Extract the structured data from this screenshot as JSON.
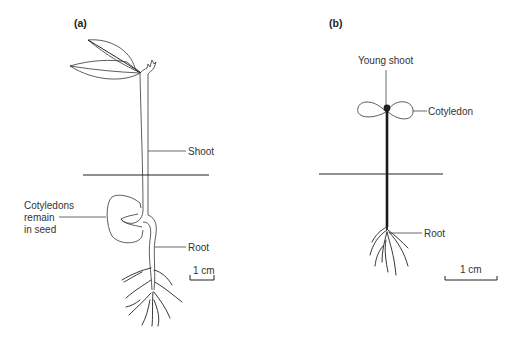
{
  "figure": {
    "colors": {
      "line": "#222222",
      "text": "#333333",
      "background": "#ffffff"
    }
  },
  "panel_a": {
    "tag": "(a)",
    "labels": {
      "shoot": "Shoot",
      "cotyledons_line1": "Cotyledons",
      "cotyledons_line2": "remain",
      "cotyledons_line3": "in seed",
      "root": "Root"
    },
    "scale_bar": "1 cm"
  },
  "panel_b": {
    "tag": "(b)",
    "labels": {
      "young_shoot": "Young shoot",
      "cotyledon": "Cotyledon",
      "root": "Root"
    },
    "scale_bar": "1 cm"
  }
}
